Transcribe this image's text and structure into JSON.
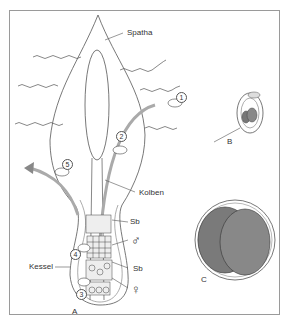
{
  "figure": {
    "panels": [
      "A",
      "B",
      "C"
    ],
    "labels": {
      "spatha": "Spatha",
      "kolben": "Kolben",
      "kessel": "Kessel",
      "sb1": "Sb",
      "sb2": "Sb",
      "male": "♂",
      "female": "♀",
      "panel_a": "A",
      "panel_b": "B",
      "panel_c": "C"
    },
    "steps": [
      "1",
      "2",
      "3",
      "4",
      "5"
    ],
    "colors": {
      "line": "#555555",
      "gray_fill": "#7a7a7a",
      "arrow": "#9a9a9a",
      "frame": "#9a9a9a"
    }
  }
}
